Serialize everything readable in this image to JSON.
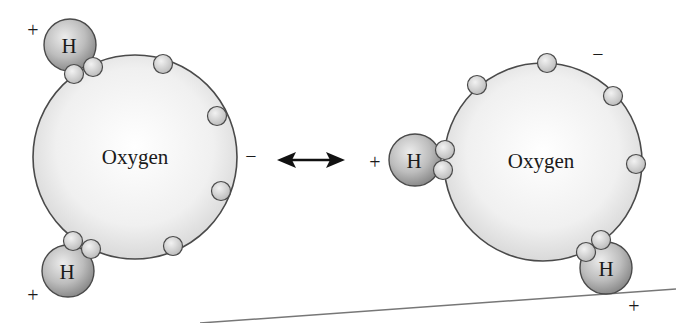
{
  "diagram": {
    "type": "water-molecule-polarity",
    "left_molecule": {
      "oxygen_label": "Oxygen",
      "hydrogen_top_label": "H",
      "hydrogen_bottom_label": "H",
      "charge_top_h": "+",
      "charge_bottom_h": "+",
      "charge_oxygen": "−",
      "electron_count": 8
    },
    "arrow": {
      "kind": "double-headed",
      "meaning": "equivalent-representations"
    },
    "right_molecule": {
      "oxygen_label": "Oxygen",
      "hydrogen_left_label": "H",
      "hydrogen_bottom_label": "H",
      "charge_left_h": "+",
      "charge_bottom_h": "+",
      "charge_oxygen": "−",
      "electron_count": 8
    },
    "colors": {
      "oxygen_fill_center": "#ffffff",
      "oxygen_fill_edge": "#d9d9d9",
      "hydrogen_fill_light": "#e6e6e6",
      "hydrogen_fill_dark": "#8c8c8c",
      "electron_fill": "#d0d0d0",
      "outline": "#4a4a4a",
      "text": "#1a1a1a"
    }
  }
}
